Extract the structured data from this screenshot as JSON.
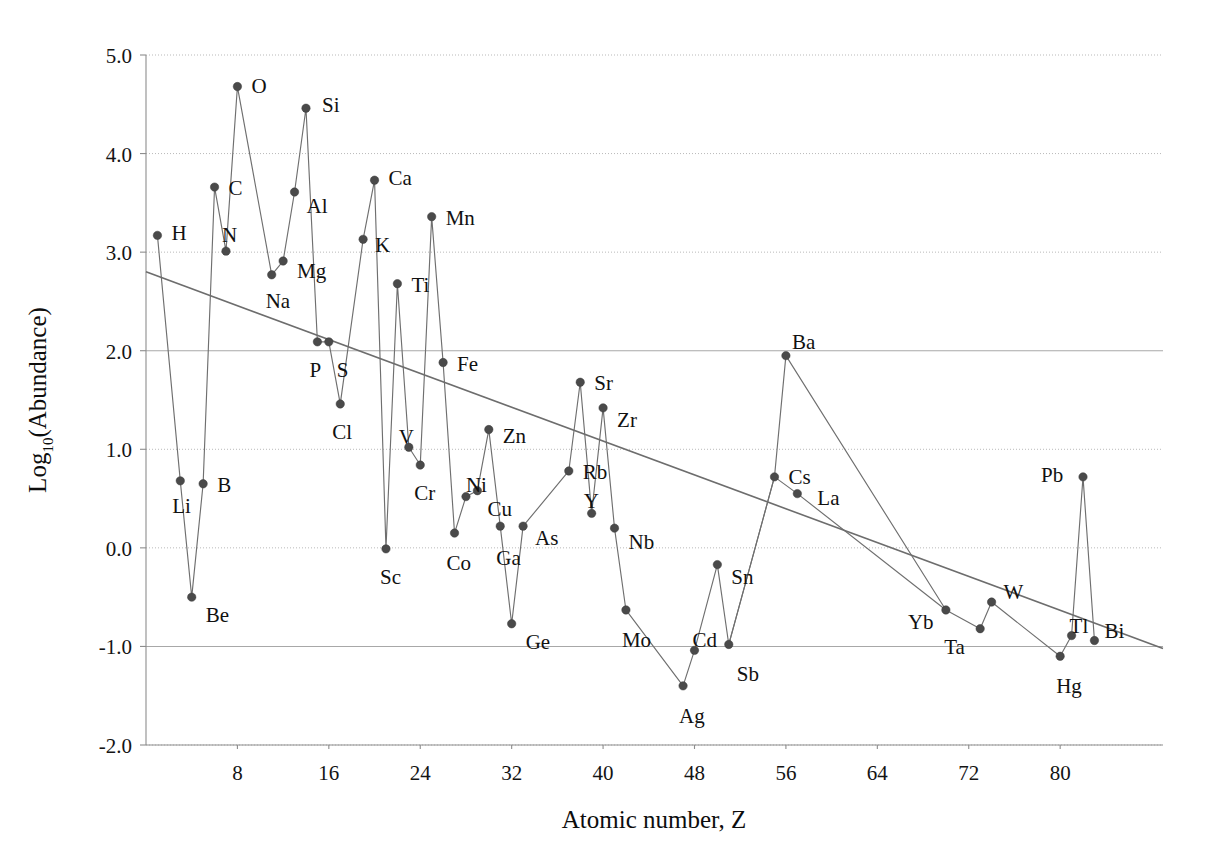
{
  "chart_data": {
    "type": "scatter",
    "title": "",
    "xlabel": "Atomic number, Z",
    "ylabel": "Log",
    "ylabel_sub": "10",
    "ylabel_rest": "(Abundance)",
    "xlim": [
      0,
      89
    ],
    "ylim": [
      -2.0,
      5.0
    ],
    "xticks": [
      8,
      16,
      24,
      32,
      40,
      48,
      56,
      64,
      72,
      80
    ],
    "yticks": [
      "5.0",
      "4.0",
      "3.0",
      "2.0",
      "1.0",
      "0.0",
      "-1.0",
      "-2.0"
    ],
    "ytick_values": [
      5.0,
      4.0,
      3.0,
      2.0,
      1.0,
      0.0,
      -1.0,
      -2.0
    ],
    "grid": true,
    "legend": "none",
    "marker_color": "#4a4a4a",
    "line_color": "#6f6f6f",
    "trend_color": "#6d6d6d",
    "series": [
      {
        "name": "Crustal abundance",
        "points": [
          {
            "label": "H",
            "z": 1,
            "value": 3.17,
            "lx": 14,
            "ly": -2
          },
          {
            "label": "Li",
            "z": 3,
            "value": 0.68,
            "lx": -8,
            "ly": 25
          },
          {
            "label": "Be",
            "z": 4,
            "value": -0.5,
            "lx": 14,
            "ly": 18
          },
          {
            "label": "B",
            "z": 5,
            "value": 0.65,
            "lx": 14,
            "ly": 1
          },
          {
            "label": "C",
            "z": 6,
            "value": 3.66,
            "lx": 14,
            "ly": 1
          },
          {
            "label": "N",
            "z": 7,
            "value": 3.01,
            "lx": -4,
            "ly": -16
          },
          {
            "label": "O",
            "z": 8,
            "value": 4.68,
            "lx": 14,
            "ly": -1
          },
          {
            "label": "Na",
            "z": 11,
            "value": 2.77,
            "lx": -6,
            "ly": 26
          },
          {
            "label": "Mg",
            "z": 12,
            "value": 2.91,
            "lx": 14,
            "ly": 10
          },
          {
            "label": "Al",
            "z": 13,
            "value": 3.61,
            "lx": 12,
            "ly": 14
          },
          {
            "label": "Si",
            "z": 14,
            "value": 4.46,
            "lx": 16,
            "ly": -3
          },
          {
            "label": "P",
            "z": 15,
            "value": 2.09,
            "lx": -8,
            "ly": 28
          },
          {
            "label": "S",
            "z": 16,
            "value": 2.09,
            "lx": 8,
            "ly": 28
          },
          {
            "label": "Cl",
            "z": 17,
            "value": 1.46,
            "lx": -8,
            "ly": 28
          },
          {
            "label": "K",
            "z": 19,
            "value": 3.13,
            "lx": 12,
            "ly": 6
          },
          {
            "label": "Ca",
            "z": 20,
            "value": 3.73,
            "lx": 14,
            "ly": -2
          },
          {
            "label": "Sc",
            "z": 21,
            "value": -0.01,
            "lx": -6,
            "ly": 28
          },
          {
            "label": "Ti",
            "z": 22,
            "value": 2.68,
            "lx": 14,
            "ly": 1
          },
          {
            "label": "V",
            "z": 23,
            "value": 1.02,
            "lx": -10,
            "ly": -10
          },
          {
            "label": "Cr",
            "z": 24,
            "value": 0.84,
            "lx": -6,
            "ly": 28
          },
          {
            "label": "Mn",
            "z": 25,
            "value": 3.36,
            "lx": 14,
            "ly": 1
          },
          {
            "label": "Fe",
            "z": 26,
            "value": 1.88,
            "lx": 14,
            "ly": 1
          },
          {
            "label": "Co",
            "z": 27,
            "value": 0.15,
            "lx": -8,
            "ly": 30
          },
          {
            "label": "Ni",
            "z": 28,
            "value": 0.52,
            "lx": 0,
            "ly": -12
          },
          {
            "label": "Cu",
            "z": 29,
            "value": 0.58,
            "lx": 10,
            "ly": 18
          },
          {
            "label": "Zn",
            "z": 30,
            "value": 1.2,
            "lx": 14,
            "ly": 6
          },
          {
            "label": "Ga",
            "z": 31,
            "value": 0.22,
            "lx": -4,
            "ly": 32
          },
          {
            "label": "Ge",
            "z": 32,
            "value": -0.77,
            "lx": 14,
            "ly": 18
          },
          {
            "label": "As",
            "z": 33,
            "value": 0.22,
            "lx": 12,
            "ly": 12
          },
          {
            "label": "Rb",
            "z": 37,
            "value": 0.78,
            "lx": 14,
            "ly": 1
          },
          {
            "label": "Sr",
            "z": 38,
            "value": 1.68,
            "lx": 14,
            "ly": 1
          },
          {
            "label": "Y",
            "z": 39,
            "value": 0.35,
            "lx": -8,
            "ly": -12
          },
          {
            "label": "Zr",
            "z": 40,
            "value": 1.42,
            "lx": 14,
            "ly": 12
          },
          {
            "label": "Nb",
            "z": 41,
            "value": 0.2,
            "lx": 14,
            "ly": 14
          },
          {
            "label": "Mo",
            "z": 42,
            "value": -0.63,
            "lx": -4,
            "ly": 30
          },
          {
            "label": "Ag",
            "z": 47,
            "value": -1.4,
            "lx": -4,
            "ly": 30
          },
          {
            "label": "Cd",
            "z": 48,
            "value": -1.04,
            "lx": -2,
            "ly": -10
          },
          {
            "label": "Sn",
            "z": 50,
            "value": -0.17,
            "lx": 14,
            "ly": 12
          },
          {
            "label": "Sb",
            "z": 51,
            "value": -0.98,
            "lx": 8,
            "ly": 30
          },
          {
            "label": "Ba",
            "z": 56,
            "value": 1.95,
            "lx": 6,
            "ly": -14
          },
          {
            "label": "Cs",
            "z": 55,
            "value": 0.72,
            "lx": 14,
            "ly": 0
          },
          {
            "label": "La",
            "z": 57,
            "value": 0.55,
            "lx": 20,
            "ly": 4
          },
          {
            "label": "Yb",
            "z": 70,
            "value": -0.63,
            "lx": -38,
            "ly": 12
          },
          {
            "label": "Ta",
            "z": 73,
            "value": -0.82,
            "lx": -36,
            "ly": 18
          },
          {
            "label": "W",
            "z": 74,
            "value": -0.55,
            "lx": 12,
            "ly": -10
          },
          {
            "label": "Hg",
            "z": 80,
            "value": -1.1,
            "lx": -4,
            "ly": 30
          },
          {
            "label": "Tl",
            "z": 81,
            "value": -0.89,
            "lx": -2,
            "ly": -10
          },
          {
            "label": "Pb",
            "z": 82,
            "value": 0.72,
            "lx": -42,
            "ly": -2
          },
          {
            "label": "Bi",
            "z": 83,
            "value": -0.94,
            "lx": 10,
            "ly": -10
          }
        ],
        "connections": [
          [
            "H",
            "Li",
            "Be",
            "B",
            "C",
            "N",
            "O",
            "Na",
            "Mg",
            "Al",
            "Si",
            "P",
            "S",
            "Cl",
            "K",
            "Ca",
            "Sc",
            "Ti",
            "V",
            "Cr",
            "Mn",
            "Fe",
            "Co",
            "Ni",
            "Cu",
            "Zn",
            "Ga",
            "Ge",
            "As"
          ],
          [
            "Rb",
            "Sr",
            "Y",
            "Zr",
            "Nb",
            "Mo",
            "Ag",
            "Cd",
            "Sn",
            "Sb",
            "Cs",
            "Ba"
          ],
          [
            "Ba",
            "Yb",
            "Ta",
            "W",
            "Hg",
            "Tl",
            "Pb",
            "Bi"
          ],
          [
            "Cs",
            "La",
            "Yb"
          ],
          [
            "As",
            "Rb"
          ],
          [
            "Sb",
            "Cs"
          ]
        ]
      }
    ],
    "trend": {
      "name": "log-linear fit",
      "x0": 0.0,
      "y0": 2.8,
      "x1": 89.0,
      "y1": -1.02
    }
  },
  "plot": {
    "left_px": 146,
    "right_px": 1163,
    "top_px": 55,
    "bottom_px": 745
  }
}
